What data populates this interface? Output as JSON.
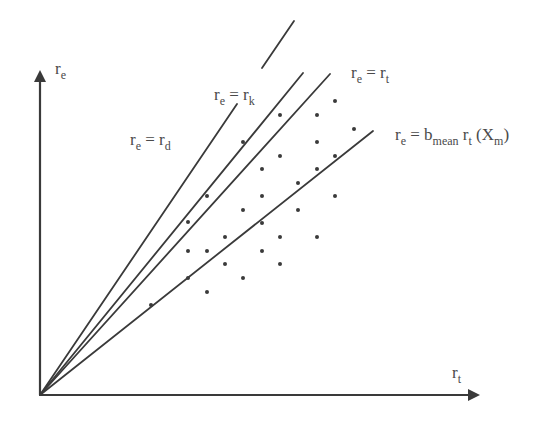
{
  "figure": {
    "type": "conceptual-scatter-with-rays",
    "width": 559,
    "height": 421,
    "origin": [
      40,
      395
    ],
    "colors": {
      "ink": "#3a3a3a",
      "label": "#4a4a4a",
      "background": "#ffffff"
    }
  },
  "axes": {
    "x": {
      "label_main": "r",
      "label_sub": "t",
      "end": [
        470,
        395
      ],
      "label_pos": [
        452,
        378
      ]
    },
    "y": {
      "label_main": "r",
      "label_sub": "e",
      "end": [
        40,
        80
      ],
      "label_pos": [
        55,
        74
      ]
    }
  },
  "lines": [
    {
      "id": "re-eq-rd",
      "label_main": "r",
      "label_sub1": "e",
      "label_eq": " = r",
      "label_sub2": "d",
      "label_tail": "",
      "end": [
        237,
        104
      ],
      "label_pos": [
        130,
        145
      ],
      "dashed_extension": null
    },
    {
      "id": "re-eq-rk",
      "label_main": "r",
      "label_sub1": "e",
      "label_eq": " = r",
      "label_sub2": "k",
      "label_tail": "",
      "end": [
        303,
        73
      ],
      "label_pos": [
        214,
        100
      ],
      "dashed_extension": [
        [
          262,
          68
        ],
        [
          294,
          21
        ]
      ]
    },
    {
      "id": "re-eq-rt",
      "label_main": "r",
      "label_sub1": "e",
      "label_eq": " = r",
      "label_sub2": "t",
      "label_tail": "",
      "end": [
        330,
        74
      ],
      "label_pos": [
        351,
        78
      ],
      "dashed_extension": null
    },
    {
      "id": "re-eq-bmean-rt-xm",
      "label_main": "r",
      "label_sub1": "e",
      "label_eq": " = b",
      "label_sub2": "mean",
      "label_tail": " r",
      "label_sub3": "t",
      "label_tail2": " (X",
      "label_sub4": "m",
      "label_tail3": ")",
      "end": [
        373,
        131
      ],
      "label_pos": [
        395,
        140
      ],
      "dashed_extension": null
    }
  ],
  "labels": {
    "re_rd": "r_e = r_d",
    "re_rk": "r_e = r_k",
    "re_rt": "r_e = r_t",
    "re_bmean": "r_e = b_mean r_t (X_m)",
    "x_axis": "r_t",
    "y_axis": "r_e"
  },
  "points": [
    [
      335,
      101
    ],
    [
      280,
      115
    ],
    [
      317,
      115
    ],
    [
      354,
      129
    ],
    [
      243,
      142
    ],
    [
      317,
      142
    ],
    [
      280,
      156
    ],
    [
      335,
      156
    ],
    [
      207,
      196
    ],
    [
      262,
      169
    ],
    [
      317,
      169
    ],
    [
      298,
      183
    ],
    [
      262,
      196
    ],
    [
      335,
      196
    ],
    [
      243,
      210
    ],
    [
      298,
      210
    ],
    [
      188,
      222
    ],
    [
      262,
      223
    ],
    [
      280,
      237
    ],
    [
      317,
      237
    ],
    [
      225,
      237
    ],
    [
      188,
      251
    ],
    [
      207,
      251
    ],
    [
      262,
      251
    ],
    [
      280,
      264
    ],
    [
      225,
      264
    ],
    [
      243,
      278
    ],
    [
      188,
      278
    ],
    [
      207,
      292
    ],
    [
      151,
      305
    ]
  ]
}
